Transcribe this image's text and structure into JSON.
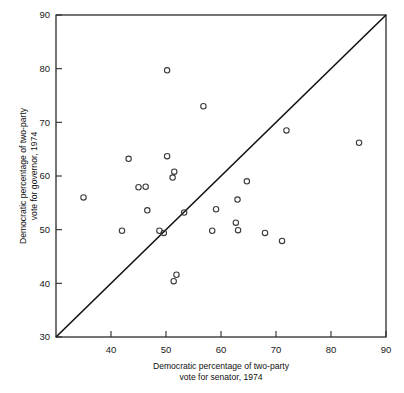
{
  "chart_data": {
    "type": "scatter",
    "title": "",
    "xlabel": "Democratic percentage of two-party vote for senator, 1974",
    "xlabel_line1": "Democratic percentage of two-party",
    "xlabel_line2": "vote for senator, 1974",
    "ylabel": "Democratic percentage of two-party vote for governor, 1974",
    "ylabel_line1": "Democratic percentage of two-party",
    "ylabel_line2": "vote for governor, 1974",
    "xlim": [
      30,
      90
    ],
    "ylim": [
      30,
      90
    ],
    "xticks": [
      40,
      50,
      60,
      70,
      80,
      90
    ],
    "yticks": [
      30,
      40,
      50,
      60,
      70,
      80,
      90
    ],
    "xtick_labels": [
      "40",
      "50",
      "60",
      "70",
      "80",
      "90"
    ],
    "ytick_labels": [
      "30",
      "40",
      "50",
      "60",
      "70",
      "80",
      "90"
    ],
    "grid": false,
    "legend": false,
    "marker": "open-circle",
    "marker_color": "#3a3a3a",
    "reference_line": {
      "name": "y = x identity line",
      "from": [
        30,
        30
      ],
      "to": [
        90,
        90
      ],
      "color": "#111111"
    },
    "points": [
      {
        "x": 35.0,
        "y": 56.0
      },
      {
        "x": 42.0,
        "y": 49.8
      },
      {
        "x": 43.2,
        "y": 63.2
      },
      {
        "x": 45.0,
        "y": 57.9
      },
      {
        "x": 46.3,
        "y": 58.0
      },
      {
        "x": 46.6,
        "y": 53.6
      },
      {
        "x": 48.8,
        "y": 49.8
      },
      {
        "x": 49.6,
        "y": 49.4
      },
      {
        "x": 50.2,
        "y": 79.7
      },
      {
        "x": 50.2,
        "y": 63.7
      },
      {
        "x": 51.2,
        "y": 59.7
      },
      {
        "x": 51.5,
        "y": 60.8
      },
      {
        "x": 51.4,
        "y": 40.4
      },
      {
        "x": 51.9,
        "y": 41.6
      },
      {
        "x": 53.3,
        "y": 53.2
      },
      {
        "x": 56.8,
        "y": 73.0
      },
      {
        "x": 58.4,
        "y": 49.8
      },
      {
        "x": 59.1,
        "y": 53.8
      },
      {
        "x": 62.7,
        "y": 51.3
      },
      {
        "x": 63.0,
        "y": 55.6
      },
      {
        "x": 63.1,
        "y": 49.9
      },
      {
        "x": 64.7,
        "y": 59.0
      },
      {
        "x": 68.0,
        "y": 49.4
      },
      {
        "x": 71.1,
        "y": 47.9
      },
      {
        "x": 71.9,
        "y": 68.5
      },
      {
        "x": 85.1,
        "y": 66.2
      }
    ]
  }
}
